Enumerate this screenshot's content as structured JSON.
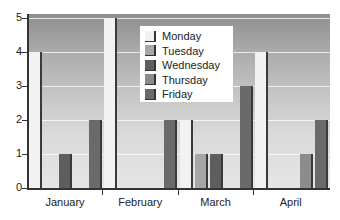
{
  "chart_data": {
    "type": "bar",
    "title": "",
    "xlabel": "",
    "ylabel": "",
    "ylim": [
      0,
      5
    ],
    "yticks": [
      0,
      1,
      2,
      3,
      4,
      5
    ],
    "grid": true,
    "legend_position": "upper center",
    "categories": [
      "January",
      "February",
      "March",
      "April"
    ],
    "series": [
      {
        "name": "Monday",
        "color": "#f2f2f2",
        "values": [
          4,
          5,
          2,
          4
        ]
      },
      {
        "name": "Tuesday",
        "color": "#a6a6a6",
        "values": [
          0,
          0,
          1,
          0
        ]
      },
      {
        "name": "Wednesday",
        "color": "#5e5e5e",
        "values": [
          1,
          0,
          1,
          0
        ]
      },
      {
        "name": "Thursday",
        "color": "#8c8c8c",
        "values": [
          0,
          0,
          0,
          1
        ]
      },
      {
        "name": "Friday",
        "color": "#6a6a6a",
        "values": [
          2,
          2,
          3,
          2
        ]
      }
    ]
  },
  "legend": {
    "items": [
      "Monday",
      "Tuesday",
      "Wednesday",
      "Thursday",
      "Friday"
    ]
  },
  "axes": {
    "y_labels": [
      "0",
      "1",
      "2",
      "3",
      "4",
      "5"
    ],
    "x_labels": [
      "January",
      "February",
      "March",
      "April"
    ]
  }
}
